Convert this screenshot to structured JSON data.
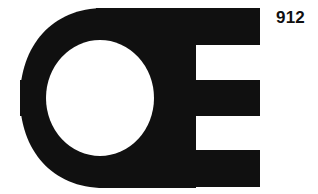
{
  "image": {
    "kind": "trademark-logo-drawing",
    "background_color": "#ffffff",
    "ink_color": "#101010",
    "width": 318,
    "height": 194
  },
  "reference": {
    "number": "912"
  },
  "logo": {
    "name": "oe-monogram",
    "description": "Bold monogram of a thick ring (letter e / C) merged with a letter E formed by three horizontal bars extending to the right",
    "ink_color": "#101010",
    "parts": [
      {
        "name": "outer-ring",
        "label": "e-ring"
      },
      {
        "name": "top-bar",
        "label": "E top arm"
      },
      {
        "name": "middle-bar",
        "label": "E middle arm"
      },
      {
        "name": "bottom-bar",
        "label": "E bottom arm"
      },
      {
        "name": "inner-counter",
        "label": "white circular counter"
      }
    ]
  }
}
